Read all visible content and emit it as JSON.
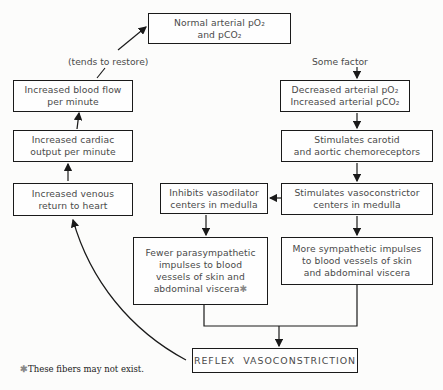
{
  "boxes": {
    "normal": {
      "line1": "Normal arterial pO₂",
      "line2": "and pCO₂"
    },
    "blood_flow": {
      "line1": "Increased blood flow",
      "line2": "per minute"
    },
    "cardiac": {
      "line1": "Increased cardiac",
      "line2": "output per minute"
    },
    "venous": {
      "line1": "Increased venous",
      "line2": "return to heart"
    },
    "decreased": {
      "line1": "Decreased arterial pO₂",
      "line2": "Increased arterial pCO₂"
    },
    "chemoreceptors": {
      "line1": "Stimulates carotid",
      "line2": "and aortic chemoreceptors"
    },
    "vasoconstrictor": {
      "line1": "Stimulates vasoconstrictor",
      "line2": "centers in medulla"
    },
    "vasodilator": {
      "line1": "Inhibits vasodilator",
      "line2": "centers in medulla"
    },
    "parasympathetic": {
      "line1": "Fewer parasympathetic",
      "line2": "impulses to blood",
      "line3": "vessels of skin and",
      "line4": "abdominal viscera",
      "marker": "✱"
    },
    "sympathetic": {
      "line1": "More sympathetic impulses",
      "line2": "to blood vessels of skin",
      "line3": "and abdominal viscera"
    },
    "reflex": {
      "line1": "REFLEX  VASOCONSTRICTION"
    }
  },
  "labels": {
    "tends_to_restore": "(tends to restore)",
    "some_factor": "Some factor"
  },
  "footnote": {
    "marker": "✱",
    "text": "These fibers may not exist."
  },
  "colors": {
    "line": "#1a1a1a",
    "text": "#4a4a4a",
    "background": "#fcfcfb"
  }
}
